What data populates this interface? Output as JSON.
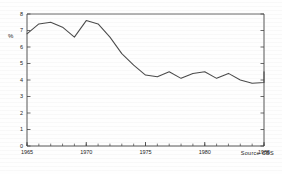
{
  "chart_data": {
    "type": "line",
    "title": "",
    "subtitle": "",
    "xlabel": "",
    "ylabel": "%",
    "xlim": [
      1965,
      1985
    ],
    "ylim": [
      0,
      8
    ],
    "ytick_labels": [
      "0",
      "1",
      "2",
      "3",
      "4",
      "5",
      "6",
      "7",
      "8"
    ],
    "yticks": [
      0,
      1,
      2,
      3,
      4,
      5,
      6,
      7,
      8
    ],
    "xtick_labels": [
      "1965",
      "1970",
      "1975",
      "1980",
      "1985"
    ],
    "xticks": [
      1965,
      1970,
      1975,
      1980,
      1985
    ],
    "minor_xtick_interval": 1,
    "grid": false,
    "legend": null,
    "line_color": "#444444",
    "axis_color": "#333333",
    "annotations": [
      {
        "name": "source-note",
        "text": "Source  CBS",
        "position": "bottom-right"
      }
    ],
    "x": [
      1965,
      1966,
      1967,
      1968,
      1969,
      1970,
      1971,
      1972,
      1973,
      1974,
      1975,
      1976,
      1977,
      1978,
      1979,
      1980,
      1981,
      1982,
      1983,
      1984,
      1985
    ],
    "values": [
      6.8,
      7.4,
      7.5,
      7.2,
      6.6,
      7.6,
      7.4,
      6.6,
      5.6,
      4.9,
      4.3,
      4.2,
      4.5,
      4.1,
      4.4,
      4.5,
      4.1,
      4.4,
      4.0,
      3.8,
      3.85
    ],
    "series": [
      {
        "name": "percentage",
        "values": [
          6.8,
          7.4,
          7.5,
          7.2,
          6.6,
          7.6,
          7.4,
          6.6,
          5.6,
          4.9,
          4.3,
          4.2,
          4.5,
          4.1,
          4.4,
          4.5,
          4.1,
          4.4,
          4.0,
          3.8,
          3.85
        ],
        "end_value": 4.5
      }
    ]
  },
  "axes": {
    "y_axis_title": "%",
    "source_text": "Source  CBS"
  }
}
